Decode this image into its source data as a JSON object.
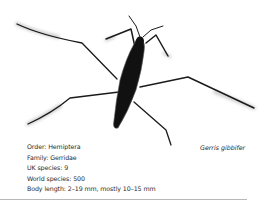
{
  "illustration": {
    "subject": "water strider (pond skater) insect, top view",
    "colors": {
      "body": "#111111",
      "leg": "#1a1a1a",
      "shadow": "#c8c8c8"
    }
  },
  "species_name": "Gerris gibbifer",
  "facts": [
    {
      "label": "Order",
      "value": "Hemiptera",
      "text": "Order: Hemiptera"
    },
    {
      "label": "Family",
      "value": "Gerridae",
      "text": "Family: Gerridae"
    },
    {
      "label": "UK species",
      "value": "9",
      "text": "UK species: 9"
    },
    {
      "label": "World species",
      "value": "500",
      "text": "World species: 500"
    },
    {
      "label": "Body length",
      "value": "2–19 mm, mostly 10–15 mm",
      "text": "Body length: 2–19 mm, mostly 10–15 mm"
    }
  ]
}
